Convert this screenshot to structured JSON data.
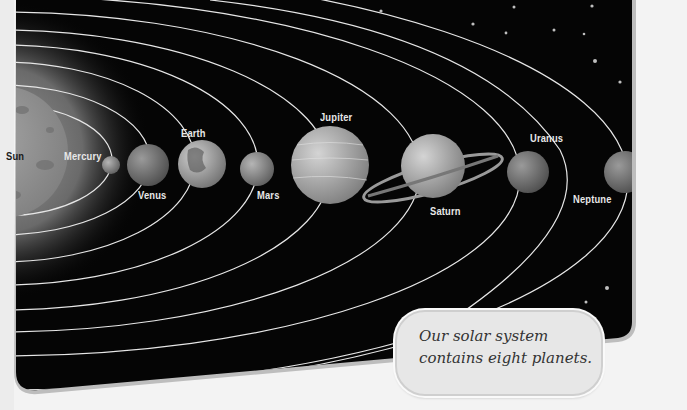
{
  "diagram": {
    "title": "Solar System",
    "sun_label": "Sun",
    "planets": [
      {
        "name": "Mercury"
      },
      {
        "name": "Venus"
      },
      {
        "name": "Earth"
      },
      {
        "name": "Mars"
      },
      {
        "name": "Jupiter"
      },
      {
        "name": "Saturn"
      },
      {
        "name": "Uranus"
      },
      {
        "name": "Neptune"
      }
    ],
    "callout": {
      "line1": "Our solar system",
      "line2": "contains eight planets."
    },
    "colors": {
      "space": "#050505",
      "orbit": "#e6e6e6",
      "panel_border": "#bdbdbd",
      "page": "#f3f3f3"
    }
  }
}
